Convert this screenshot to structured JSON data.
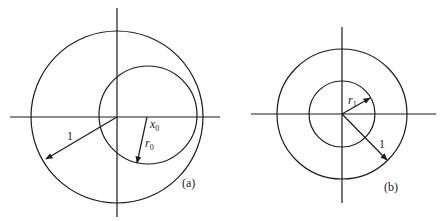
{
  "figure_a": {
    "label": "(a)",
    "unit_radius_label": "1",
    "offset_label": "x",
    "offset_sub": "0",
    "radius_label": "r",
    "radius_sub": "0",
    "axes_center": [
      117,
      117
    ],
    "unit_circle": {
      "cx": 117,
      "cy": 117,
      "r": 86
    },
    "offset_circle": {
      "cx": 148,
      "cy": 115,
      "r": 49
    }
  },
  "figure_b": {
    "label": "(b)",
    "unit_radius_label": "1",
    "radius_label": "r",
    "radius_sub": "1",
    "axes_center": [
      342,
      114
    ],
    "unit_circle": {
      "cx": 342,
      "cy": 114,
      "r": 65
    },
    "inner_circle": {
      "cx": 342,
      "cy": 114,
      "r": 33
    }
  },
  "colors": {
    "ink": "#1a1a1a",
    "background": "#ffffff"
  }
}
